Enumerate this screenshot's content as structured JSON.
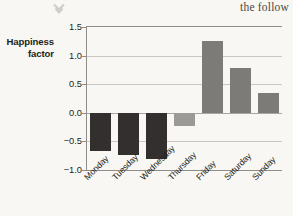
{
  "page": {
    "background_color": "#f8f7f4",
    "text_fragment": "the follow",
    "chevron_icon": "chevron-down-icon"
  },
  "chart_data": {
    "type": "bar",
    "title": "",
    "xlabel": "",
    "ylabel": "Happiness factor",
    "ylabel_lines": [
      "Happiness",
      "factor"
    ],
    "categories": [
      "Monday",
      "Tuesday",
      "Wednesday",
      "Thursday",
      "Friday",
      "Saturday",
      "Sunday"
    ],
    "values": [
      -0.67,
      -0.74,
      -0.81,
      -0.23,
      1.26,
      0.79,
      0.34
    ],
    "bar_colors": [
      "#332f2e",
      "#332f2e",
      "#332f2e",
      "#9b9a97",
      "#7d7b78",
      "#7d7b78",
      "#7d7b78"
    ],
    "ylim": [
      -1.0,
      1.5
    ],
    "yticks": [
      1.5,
      1.0,
      0.5,
      0.0,
      -0.5,
      -1.0
    ],
    "ytick_labels": [
      "1.5",
      "1.0",
      "0.5",
      "0.0",
      "−0.5",
      "−1.0"
    ],
    "grid": true,
    "legend": "none",
    "xtick_rotation": -45
  }
}
